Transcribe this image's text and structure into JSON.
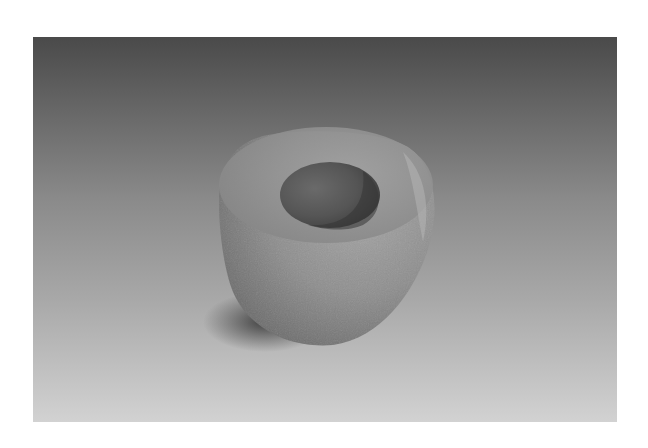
{
  "image": {
    "subject": "stone mortar",
    "alt": "Photograph of a round carved stone mortar with a shallow circular bowl, on a gray gradient backdrop",
    "frame": {
      "x": 33,
      "y": 37,
      "width": 584,
      "height": 385
    },
    "page_background": "#ffffff"
  },
  "colors": {
    "backdrop_top": "#4a4a4a",
    "backdrop_mid": "#8a8a8a",
    "backdrop_lower": "#a8a8a8",
    "backdrop_bottom": "#d2d2d2",
    "stone_light": "#a6a6a6",
    "stone_mid": "#8e8e8e",
    "stone_dark": "#6a6a6a",
    "bowl_interior": "#5a5a5a",
    "bowl_shadow": "#3e3e3e",
    "cast_shadow": "#3a3a3a"
  }
}
